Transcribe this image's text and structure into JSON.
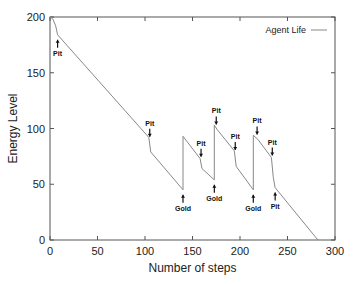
{
  "chart_data": {
    "type": "line",
    "title": "",
    "xlabel": "Number of steps",
    "ylabel": "Energy Level",
    "xlim": [
      0,
      300
    ],
    "ylim": [
      0,
      200
    ],
    "xticks": [
      0,
      50,
      100,
      150,
      200,
      250,
      300
    ],
    "yticks": [
      0,
      50,
      100,
      150,
      200
    ],
    "grid": false,
    "legend": {
      "position": "top-right",
      "entries": [
        "Agent Life"
      ]
    },
    "series": [
      {
        "name": "Agent Life",
        "color": "#888888",
        "points": [
          [
            0,
            200
          ],
          [
            3,
            198
          ],
          [
            6,
            192
          ],
          [
            8,
            184
          ],
          [
            104,
            92
          ],
          [
            104,
            92
          ],
          [
            106,
            79
          ],
          [
            140,
            45
          ],
          [
            140,
            93
          ],
          [
            158,
            73
          ],
          [
            160,
            64
          ],
          [
            173,
            54
          ],
          [
            173,
            103
          ],
          [
            176,
            99
          ],
          [
            194,
            80
          ],
          [
            196,
            66
          ],
          [
            214,
            45
          ],
          [
            214,
            94
          ],
          [
            219,
            90
          ],
          [
            233,
            74
          ],
          [
            235,
            56
          ],
          [
            237,
            47
          ],
          [
            282,
            0
          ]
        ]
      }
    ],
    "annotations": [
      {
        "text": "Pit",
        "x": 8,
        "y": 184,
        "arrow": "up"
      },
      {
        "text": "Pit",
        "x": 105,
        "y": 90,
        "arrow": "down"
      },
      {
        "text": "Gold",
        "x": 140,
        "y": 45,
        "arrow": "up"
      },
      {
        "text": "Pit",
        "x": 159,
        "y": 72,
        "arrow": "down"
      },
      {
        "text": "Pit",
        "x": 175,
        "y": 101,
        "arrow": "down"
      },
      {
        "text": "Gold",
        "x": 173,
        "y": 54,
        "arrow": "up"
      },
      {
        "text": "Pit",
        "x": 195,
        "y": 78,
        "arrow": "down"
      },
      {
        "text": "Gold",
        "x": 214,
        "y": 45,
        "arrow": "up"
      },
      {
        "text": "Pit",
        "x": 218,
        "y": 92,
        "arrow": "down"
      },
      {
        "text": "Pit",
        "x": 234,
        "y": 73,
        "arrow": "down"
      },
      {
        "text": "Pit",
        "x": 237,
        "y": 47,
        "arrow": "up"
      }
    ]
  }
}
